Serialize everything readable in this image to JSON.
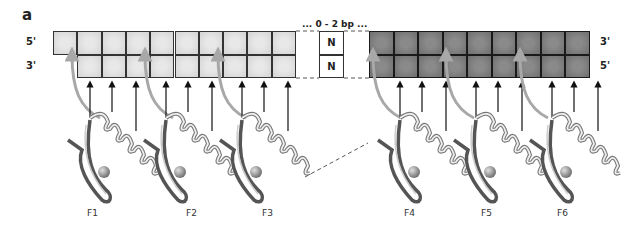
{
  "panel_label": "a",
  "dna": {
    "left_strand_labels": {
      "top": "5'",
      "bottom": "3'"
    },
    "right_strand_labels": {
      "top": "3'",
      "bottom": "5'"
    },
    "gap_label": "... 0 - 2 bp ...",
    "gap_bases": [
      "N",
      "N"
    ],
    "left_half_site": {
      "top_row_cells": 10,
      "bottom_row_cells": 9,
      "shade": "light",
      "color": "#dcdcdc"
    },
    "right_half_site": {
      "top_row_cells": 9,
      "bottom_row_cells": 9,
      "shade": "dark",
      "color": "#7a7a7a"
    }
  },
  "fingers": [
    {
      "label": "F1"
    },
    {
      "label": "F2"
    },
    {
      "label": "F3"
    },
    {
      "label": "F4"
    },
    {
      "label": "F5"
    },
    {
      "label": "F6"
    }
  ],
  "colors": {
    "light_cells": "#dcdcdc",
    "dark_cells": "#7a7a7a",
    "grid_line": "#333333",
    "curved_arrow": "#a8a8a8",
    "straight_arrow": "#111111",
    "ribbon": "#8c8c8c"
  }
}
